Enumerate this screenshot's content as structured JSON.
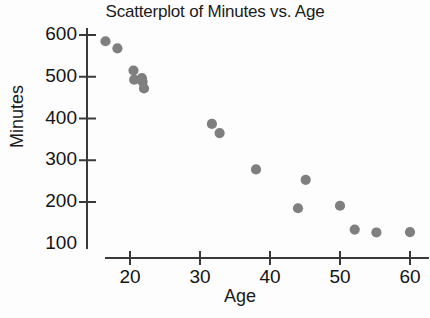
{
  "chart_data": {
    "type": "scatter",
    "title": "Scatterplot of Minutes vs. Age",
    "xlabel": "Age",
    "ylabel": "Minutes",
    "xlim": [
      14,
      63
    ],
    "ylim": [
      90,
      620
    ],
    "grid": false,
    "legend": "none",
    "marker_color": "#7f7f7f",
    "axis_color": "#3a3a3a",
    "x_ticks": [
      20,
      30,
      40,
      50,
      60
    ],
    "y_ticks": [
      100,
      200,
      300,
      400,
      500,
      600
    ],
    "x_tick_labels": [
      "20",
      "30",
      "40",
      "50",
      "60"
    ],
    "y_tick_labels": [
      "100",
      "200",
      "300",
      "400",
      "500",
      "600"
    ],
    "series": [
      {
        "name": "Minutes vs. Age",
        "points": [
          {
            "x": 16.5,
            "y": 585
          },
          {
            "x": 18.2,
            "y": 568
          },
          {
            "x": 20.5,
            "y": 515
          },
          {
            "x": 20.6,
            "y": 493
          },
          {
            "x": 21.7,
            "y": 497
          },
          {
            "x": 21.8,
            "y": 488
          },
          {
            "x": 22.0,
            "y": 472
          },
          {
            "x": 31.7,
            "y": 387
          },
          {
            "x": 32.8,
            "y": 365
          },
          {
            "x": 38.0,
            "y": 278
          },
          {
            "x": 45.1,
            "y": 253
          },
          {
            "x": 44.0,
            "y": 185
          },
          {
            "x": 50.0,
            "y": 191
          },
          {
            "x": 52.1,
            "y": 134
          },
          {
            "x": 55.2,
            "y": 127
          },
          {
            "x": 60.0,
            "y": 128
          }
        ]
      }
    ]
  },
  "labels": {
    "title": "Scatterplot of Minutes vs. Age",
    "x_axis": "Age",
    "y_axis": "Minutes"
  }
}
